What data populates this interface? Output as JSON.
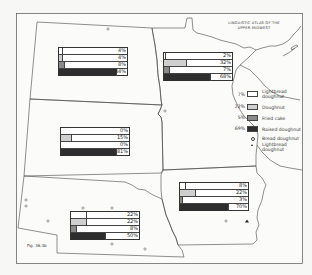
{
  "title_line1": "LINGUISTIC ATLAS OF THE",
  "title_line2": "UPPER MIDWEST",
  "figure_label": "Fig. 36.3b",
  "colors": {
    "lightbread": "#ffffff",
    "doughnut": "#cfcfcf",
    "fried_cake": "#8a8a8a",
    "raised": "#2e2e2e",
    "line": "#444444",
    "background": "#f7f7f5"
  },
  "legend": {
    "items": [
      {
        "pct": "7%",
        "label_line1": "Lightbread",
        "label_line2": "doughnut"
      },
      {
        "pct": "22%",
        "label_line1": "Doughnut",
        "label_line2": ""
      },
      {
        "pct": "5%",
        "label_line1": "Fried cake",
        "label_line2": ""
      },
      {
        "pct": "69%",
        "label_line1": "Raised doughnut",
        "label_line2": ""
      }
    ],
    "symbols": [
      {
        "symbol": "circle",
        "label_line1": "Bread doughnut",
        "label_line2": ""
      },
      {
        "symbol": "triangle",
        "label_line1": "Lightbread",
        "label_line2": "doughnut"
      }
    ]
  },
  "chart_data": {
    "type": "bar",
    "title": "Linguistic Atlas of the Upper Midwest",
    "subtitle": "Fig. 36.3b",
    "categories": [
      "Lightbread doughnut",
      "Doughnut",
      "Fried cake",
      "Raised doughnut"
    ],
    "series": [
      {
        "name": "North Dakota",
        "values": [
          4,
          4,
          8,
          84
        ]
      },
      {
        "name": "Minnesota",
        "values": [
          2,
          32,
          7,
          68
        ]
      },
      {
        "name": "South Dakota",
        "values": [
          0,
          15,
          0,
          81
        ]
      },
      {
        "name": "Iowa",
        "values": [
          8,
          22,
          3,
          70
        ]
      },
      {
        "name": "Nebraska",
        "values": [
          22,
          22,
          8,
          50
        ]
      },
      {
        "name": "Region total (legend)",
        "values": [
          7,
          22,
          5,
          69
        ]
      }
    ],
    "xlabel": "",
    "ylabel": "Percent",
    "ylim": [
      0,
      100
    ],
    "legend_position": "right"
  },
  "states": [
    {
      "name": "North Dakota",
      "labels": [
        "4%",
        "4%",
        "8%",
        "84%"
      ],
      "values": [
        4,
        4,
        8,
        84
      ]
    },
    {
      "name": "Minnesota",
      "labels": [
        "2%",
        "32%",
        "7%",
        "68%"
      ],
      "values": [
        2,
        32,
        7,
        68
      ]
    },
    {
      "name": "South Dakota",
      "labels": [
        "0%",
        "15%",
        "0%",
        "81%"
      ],
      "values": [
        0,
        15,
        0,
        81
      ]
    },
    {
      "name": "Iowa",
      "labels": [
        "8%",
        "22%",
        "3%",
        "70%"
      ],
      "values": [
        8,
        22,
        3,
        70
      ]
    },
    {
      "name": "Nebraska",
      "labels": [
        "22%",
        "22%",
        "8%",
        "50%"
      ],
      "values": [
        22,
        22,
        8,
        50
      ]
    }
  ]
}
